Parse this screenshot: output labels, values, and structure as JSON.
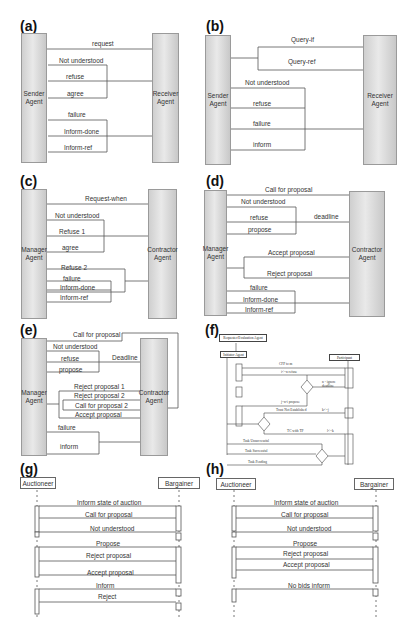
{
  "panels": {
    "a": {
      "label": "(a)",
      "left_agent": "Sender\nAgent",
      "right_agent": "Receiver\nAgent",
      "messages": [
        "request",
        "Not understood",
        "refuse",
        "agree",
        "failure",
        "Inform-done",
        "Inform-ref"
      ]
    },
    "b": {
      "label": "(b)",
      "left_agent": "Sender\nAgent",
      "right_agent": "Receiver\nAgent",
      "messages": [
        "Query-if",
        "Query-ref",
        "Not understood",
        "refuse",
        "failure",
        "inform"
      ]
    },
    "c": {
      "label": "(c)",
      "left_agent": "Manager\nAgent",
      "right_agent": "Contractor\nAgent",
      "messages": [
        "Request-when",
        "Not understood",
        "Refuse 1",
        "agree",
        "Refuse 2",
        "failure",
        "Inform-done",
        "Inform-ref"
      ]
    },
    "d": {
      "label": "(d)",
      "left_agent": "Manager\nAgent",
      "right_agent": "Contractor\nAgent",
      "messages": [
        "Call for proposal",
        "Not understood",
        "refuse",
        "deadline",
        "propose",
        "Accept proposal",
        "Reject proposal",
        "failure",
        "Inform-done",
        "Inform-ref"
      ]
    },
    "e": {
      "label": "(e)",
      "left_agent": "Manager\nAgent",
      "right_agent": "Contractor\nAgent",
      "messages": [
        "Call for proposal",
        "Not understood",
        "refuse",
        "Deadline",
        "propose",
        "Reject proposal 1",
        "Reject proposal 2",
        "Call for proposal 2",
        "Accept proposal",
        "failure",
        "inform"
      ]
    },
    "f": {
      "label": "(f)",
      "top_box": "Requester/Evaluation Agent",
      "initiator": "Initiator Agent",
      "participant": "Participant",
      "messages": [
        "CFP to m",
        "i<=n refuse",
        "n - ignore deadline",
        "j=n-i propose",
        "Trust Not Established",
        "k<=j",
        "TC with TP",
        "l<=k",
        "Task Unsuccessful",
        "Task Successful",
        "Task Pending"
      ]
    },
    "g": {
      "label": "(g)",
      "left_actor": "Auctioneer",
      "right_actor": "Bargainer",
      "messages": [
        "Inform state of auction",
        "Call for proposal",
        "Not understood",
        "Propose",
        "Reject proposal",
        "Accept proposal",
        "Inform",
        "Reject"
      ]
    },
    "h": {
      "label": "(h)",
      "left_actor": "Auctioneer",
      "right_actor": "Bargainer",
      "messages": [
        "Inform state of auction",
        "Call for proposal",
        "Not understood",
        "Propose",
        "Reject proposal",
        "Accept proposal",
        "No bids inform"
      ]
    }
  }
}
